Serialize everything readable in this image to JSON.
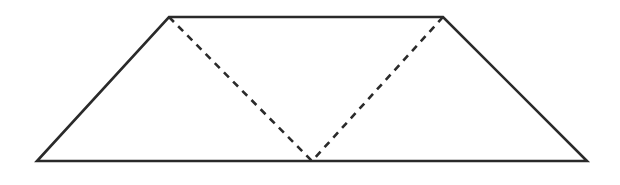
{
  "canvas": {
    "width": 620,
    "height": 185,
    "background": "#ffffff"
  },
  "figure": {
    "type": "trapezoid-with-inscribed-triangle",
    "stroke_color": "#2a2a2a",
    "vertices": {
      "top_left": [
        169,
        17
      ],
      "top_right": [
        443,
        17
      ],
      "bottom_right": [
        587,
        161
      ],
      "bottom_left": [
        37,
        161
      ],
      "base_point": [
        312,
        161
      ]
    },
    "solid_edges": [
      [
        "top_left",
        "top_right"
      ],
      [
        "top_right",
        "bottom_right"
      ],
      [
        "bottom_right",
        "bottom_left"
      ],
      [
        "bottom_left",
        "top_left"
      ]
    ],
    "dashed_edges": [
      [
        "top_left",
        "base_point"
      ],
      [
        "top_right",
        "base_point"
      ]
    ]
  }
}
